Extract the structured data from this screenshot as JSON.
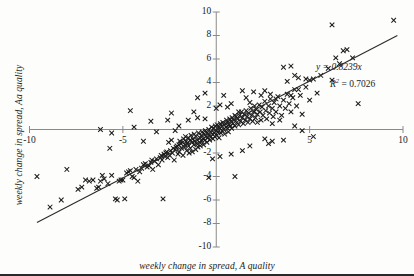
{
  "chart_data": {
    "type": "scatter",
    "title": "",
    "xlabel": "weekly change in spread, A quality",
    "ylabel": "weekly change in spread, Aa quality",
    "xlim": [
      -10,
      10
    ],
    "ylim": [
      -10,
      10
    ],
    "grid": false,
    "legend": null,
    "x_ticks": [
      -10,
      -5,
      5,
      10
    ],
    "x_tick_labels": [
      "-10",
      "-5",
      "5",
      "10"
    ],
    "x_minor_ticks": [
      -10,
      -5,
      0,
      5,
      10
    ],
    "y_ticks": [
      -10,
      -8,
      -6,
      -4,
      -2,
      2,
      4,
      6,
      8,
      10
    ],
    "y_tick_labels": [
      "-10",
      "-8",
      "-6",
      "-4",
      "-2",
      "2",
      "4",
      "6",
      "8",
      "10"
    ],
    "marker": "x",
    "marker_color": "#1a1a1a",
    "axis_color": "#8a8a8a",
    "trendline": {
      "equation_label": "y = 0.8239x",
      "r2_label": "R",
      "r2_sup": "2",
      "r2_value": "= 0.7026",
      "slope": 0.8239,
      "intercept": 0,
      "color": "#2b2b2b",
      "x_start": -9.6,
      "x_end": 9.7
    },
    "annotations": [
      {
        "name": "slope-equation",
        "text": "y = 0.8239x"
      },
      {
        "name": "r-squared",
        "text": "R 2 = 0.7026"
      }
    ],
    "points": [
      [
        -9.6,
        -4.0
      ],
      [
        -8.9,
        -6.6
      ],
      [
        -8.3,
        -6.0
      ],
      [
        -8.0,
        -3.4
      ],
      [
        -7.4,
        -5.1
      ],
      [
        -7.2,
        -4.9
      ],
      [
        -7.0,
        -4.3
      ],
      [
        -6.8,
        -4.4
      ],
      [
        -6.6,
        -4.3
      ],
      [
        -6.4,
        -5.0
      ],
      [
        -6.3,
        -4.9
      ],
      [
        -6.2,
        -4.4
      ],
      [
        -6.1,
        -3.9
      ],
      [
        -6.0,
        -4.2
      ],
      [
        -5.8,
        -4.6
      ],
      [
        -5.7,
        -1.6
      ],
      [
        -5.6,
        -3.9
      ],
      [
        -5.4,
        -5.9
      ],
      [
        -5.3,
        -6.0
      ],
      [
        -5.2,
        -4.4
      ],
      [
        -5.1,
        -4.3
      ],
      [
        -5.0,
        -4.3
      ],
      [
        -4.9,
        -5.9
      ],
      [
        -4.8,
        -3.7
      ],
      [
        -4.7,
        -3.6
      ],
      [
        -4.6,
        -3.5
      ],
      [
        -4.5,
        -4.0
      ],
      [
        -4.4,
        -4.1
      ],
      [
        -4.3,
        -3.4
      ],
      [
        -4.2,
        -4.4
      ],
      [
        -4.1,
        -3.6
      ],
      [
        -4.0,
        -3.3
      ],
      [
        -3.9,
        -3.0
      ],
      [
        -3.8,
        -2.9
      ],
      [
        -3.7,
        -3.2
      ],
      [
        -3.6,
        -3.1
      ],
      [
        -3.5,
        -2.8
      ],
      [
        -3.45,
        -2.6
      ],
      [
        -3.4,
        -3.4
      ],
      [
        -3.3,
        -2.7
      ],
      [
        -3.2,
        -2.5
      ],
      [
        -3.1,
        -3.0
      ],
      [
        -3.0,
        -2.4
      ],
      [
        -2.95,
        -2.2
      ],
      [
        -2.9,
        -2.6
      ],
      [
        -2.85,
        -5.9
      ],
      [
        -2.8,
        -2.1
      ],
      [
        -2.75,
        -2.3
      ],
      [
        -2.7,
        -2.0
      ],
      [
        -2.65,
        -1.9
      ],
      [
        -2.6,
        -2.4
      ],
      [
        -2.55,
        -1.1
      ],
      [
        -2.5,
        -2.2
      ],
      [
        -2.45,
        -1.8
      ],
      [
        -2.4,
        -0.9
      ],
      [
        -2.35,
        -2.0
      ],
      [
        -2.3,
        -1.6
      ],
      [
        -2.25,
        -2.6
      ],
      [
        -2.2,
        -1.7
      ],
      [
        -2.15,
        -1.5
      ],
      [
        -2.1,
        -1.4
      ],
      [
        -2.05,
        -2.1
      ],
      [
        -2.0,
        -1.3
      ],
      [
        -1.98,
        -1.9
      ],
      [
        -1.95,
        -1.0
      ],
      [
        -1.9,
        -1.2
      ],
      [
        -1.85,
        -1.6
      ],
      [
        -1.8,
        -1.1
      ],
      [
        -1.78,
        -2.2
      ],
      [
        -1.75,
        -0.8
      ],
      [
        -1.7,
        -1.5
      ],
      [
        -1.68,
        -1.3
      ],
      [
        -1.65,
        -0.6
      ],
      [
        -1.6,
        -1.0
      ],
      [
        -1.58,
        -1.8
      ],
      [
        -1.55,
        -1.2
      ],
      [
        -1.5,
        -0.7
      ],
      [
        -1.48,
        -1.4
      ],
      [
        -1.45,
        -2.0
      ],
      [
        -1.4,
        -0.9
      ],
      [
        -1.38,
        -1.6
      ],
      [
        -1.35,
        -0.5
      ],
      [
        -1.3,
        -1.1
      ],
      [
        -1.28,
        -1.9
      ],
      [
        -1.25,
        -0.8
      ],
      [
        -1.2,
        -1.3
      ],
      [
        -1.18,
        -0.4
      ],
      [
        -1.15,
        -1.0
      ],
      [
        -1.1,
        -1.7
      ],
      [
        -1.08,
        -0.6
      ],
      [
        -1.05,
        -1.2
      ],
      [
        -1.0,
        -0.9
      ],
      [
        -0.98,
        -1.5
      ],
      [
        -0.95,
        -0.3
      ],
      [
        -0.9,
        -1.1
      ],
      [
        -0.88,
        -0.7
      ],
      [
        -0.85,
        -1.4
      ],
      [
        -0.8,
        -0.5
      ],
      [
        -0.78,
        -1.0
      ],
      [
        -0.75,
        -0.2
      ],
      [
        -0.7,
        -0.8
      ],
      [
        -0.68,
        -1.3
      ],
      [
        -0.65,
        -0.4
      ],
      [
        -0.6,
        -0.9
      ],
      [
        -0.58,
        -0.1
      ],
      [
        -0.55,
        -0.6
      ],
      [
        -0.5,
        -1.1
      ],
      [
        -0.48,
        -0.3
      ],
      [
        -0.45,
        -0.7
      ],
      [
        -0.4,
        0.0
      ],
      [
        -0.38,
        -0.5
      ],
      [
        -0.35,
        -0.9
      ],
      [
        -0.3,
        -0.2
      ],
      [
        -0.28,
        -0.6
      ],
      [
        -0.25,
        0.2
      ],
      [
        -0.2,
        -0.4
      ],
      [
        -0.18,
        -0.8
      ],
      [
        -0.15,
        0.1
      ],
      [
        -0.1,
        -0.3
      ],
      [
        -0.08,
        -0.6
      ],
      [
        -0.05,
        0.3
      ],
      [
        0.0,
        -0.1
      ],
      [
        0.02,
        -0.5
      ],
      [
        0.05,
        0.4
      ],
      [
        0.1,
        -0.2
      ],
      [
        0.12,
        0.2
      ],
      [
        0.15,
        -0.7
      ],
      [
        0.2,
        0.1
      ],
      [
        0.22,
        0.5
      ],
      [
        0.25,
        -0.3
      ],
      [
        0.3,
        0.3
      ],
      [
        0.32,
        -0.1
      ],
      [
        0.35,
        0.6
      ],
      [
        0.4,
        0.0
      ],
      [
        0.42,
        0.4
      ],
      [
        0.45,
        -0.4
      ],
      [
        0.5,
        0.5
      ],
      [
        0.52,
        0.2
      ],
      [
        0.55,
        0.8
      ],
      [
        0.6,
        0.1
      ],
      [
        0.62,
        0.6
      ],
      [
        0.65,
        -0.2
      ],
      [
        0.7,
        0.4
      ],
      [
        0.72,
        0.9
      ],
      [
        0.75,
        0.3
      ],
      [
        0.8,
        0.7
      ],
      [
        0.82,
        0.1
      ],
      [
        0.85,
        1.0
      ],
      [
        0.9,
        0.5
      ],
      [
        0.95,
        0.8
      ],
      [
        1.0,
        0.3
      ],
      [
        1.05,
        1.1
      ],
      [
        1.1,
        0.6
      ],
      [
        1.15,
        0.9
      ],
      [
        1.2,
        0.4
      ],
      [
        1.25,
        1.2
      ],
      [
        1.3,
        0.7
      ],
      [
        1.35,
        1.5
      ],
      [
        1.4,
        1.0
      ],
      [
        1.45,
        0.5
      ],
      [
        1.5,
        1.3
      ],
      [
        1.55,
        0.8
      ],
      [
        1.6,
        1.6
      ],
      [
        1.65,
        1.1
      ],
      [
        1.7,
        0.6
      ],
      [
        1.75,
        1.4
      ],
      [
        1.8,
        0.9
      ],
      [
        1.85,
        1.8
      ],
      [
        1.9,
        1.2
      ],
      [
        1.95,
        0.7
      ],
      [
        2.0,
        1.5
      ],
      [
        2.05,
        2.0
      ],
      [
        2.1,
        1.0
      ],
      [
        2.15,
        1.7
      ],
      [
        2.2,
        1.3
      ],
      [
        2.3,
        2.1
      ],
      [
        2.35,
        1.5
      ],
      [
        2.4,
        0.8
      ],
      [
        2.45,
        1.9
      ],
      [
        2.5,
        1.2
      ],
      [
        2.6,
        2.4
      ],
      [
        2.65,
        1.6
      ],
      [
        2.7,
        0.9
      ],
      [
        2.8,
        2.0
      ],
      [
        2.85,
        1.4
      ],
      [
        2.9,
        2.6
      ],
      [
        3.0,
        1.8
      ],
      [
        3.05,
        1.1
      ],
      [
        3.1,
        2.3
      ],
      [
        3.2,
        1.5
      ],
      [
        3.3,
        2.8
      ],
      [
        3.4,
        2.0
      ],
      [
        3.5,
        1.2
      ],
      [
        3.6,
        2.5
      ],
      [
        3.7,
        1.8
      ],
      [
        3.8,
        3.0
      ],
      [
        3.9,
        2.2
      ],
      [
        4.0,
        1.5
      ],
      [
        4.1,
        2.7
      ],
      [
        4.2,
        3.4
      ],
      [
        4.3,
        2.0
      ],
      [
        4.5,
        2.9
      ],
      [
        4.6,
        1.3
      ],
      [
        4.8,
        3.6
      ],
      [
        5.0,
        2.5
      ],
      [
        5.2,
        4.3
      ],
      [
        5.4,
        3.1
      ],
      [
        5.6,
        4.6
      ],
      [
        6.0,
        5.2
      ],
      [
        6.2,
        4.2
      ],
      [
        6.4,
        6.1
      ],
      [
        6.6,
        5.6
      ],
      [
        6.8,
        6.7
      ],
      [
        7.0,
        6.8
      ],
      [
        7.3,
        6.1
      ],
      [
        7.6,
        2.2
      ],
      [
        9.5,
        9.3
      ],
      [
        6.2,
        8.9
      ],
      [
        3.6,
        5.3
      ],
      [
        4.0,
        5.4
      ],
      [
        4.2,
        4.6
      ],
      [
        4.4,
        3.4
      ],
      [
        4.0,
        2.9
      ],
      [
        3.2,
        2.6
      ],
      [
        2.9,
        3.0
      ],
      [
        1.6,
        2.7
      ],
      [
        1.8,
        2.3
      ],
      [
        2.4,
        2.9
      ],
      [
        1.2,
        1.5
      ],
      [
        0.4,
        2.9
      ],
      [
        -1.2,
        1.5
      ],
      [
        -2.4,
        1.4
      ],
      [
        -3.5,
        0.7
      ],
      [
        -4.6,
        1.6
      ],
      [
        -2.6,
        0.8
      ],
      [
        -1.5,
        0.8
      ],
      [
        -0.6,
        0.9
      ],
      [
        0.6,
        1.9
      ],
      [
        2.2,
        0.6
      ],
      [
        3.0,
        0.5
      ],
      [
        3.4,
        0.8
      ],
      [
        4.2,
        0.3
      ],
      [
        4.6,
        -0.1
      ],
      [
        5.2,
        -0.6
      ],
      [
        2.6,
        -0.8
      ],
      [
        2.8,
        -1.2
      ],
      [
        3.0,
        -1.0
      ],
      [
        3.6,
        -0.9
      ],
      [
        1.8,
        -1.4
      ],
      [
        1.4,
        -1.8
      ],
      [
        0.8,
        -2.1
      ],
      [
        0.2,
        -2.3
      ],
      [
        -0.2,
        -2.5
      ],
      [
        1.0,
        -4.0
      ],
      [
        -0.4,
        -4.1
      ],
      [
        -3.9,
        -1.0
      ],
      [
        -4.4,
        0.2
      ],
      [
        -5.6,
        -0.3
      ],
      [
        -6.2,
        0.0
      ],
      [
        -2.0,
        0.3
      ],
      [
        -1.0,
        1.0
      ],
      [
        0.0,
        1.8
      ],
      [
        0.8,
        2.2
      ],
      [
        1.4,
        3.3
      ],
      [
        -0.6,
        3.1
      ],
      [
        -1.0,
        2.7
      ],
      [
        0.2,
        2.1
      ],
      [
        2.0,
        3.2
      ],
      [
        2.6,
        3.3
      ],
      [
        1.0,
        1.2
      ],
      [
        -3.2,
        -0.2
      ],
      [
        -2.2,
        -0.1
      ],
      [
        4.8,
        4.3
      ],
      [
        5.0,
        4.2
      ],
      [
        3.8,
        4.1
      ],
      [
        4.4,
        4.4
      ]
    ]
  }
}
